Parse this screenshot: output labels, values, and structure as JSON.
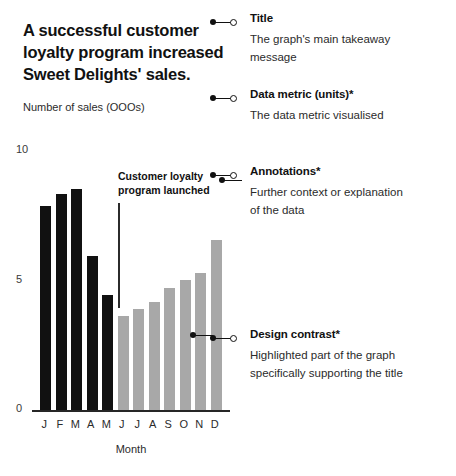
{
  "chart_data": {
    "type": "bar",
    "title": "A successful customer\nloyalty program increased\nSweet Delights' sales.",
    "ylabel": "Number of sales (OOOs)",
    "xlabel": "Month",
    "categories": [
      "J",
      "F",
      "M",
      "A",
      "M",
      "J",
      "J",
      "A",
      "S",
      "O",
      "N",
      "D"
    ],
    "category_names": [
      "January",
      "February",
      "March",
      "April",
      "May",
      "June",
      "July",
      "August",
      "September",
      "October",
      "November",
      "December"
    ],
    "values": [
      8.5,
      9.0,
      9.2,
      6.4,
      4.8,
      3.9,
      4.2,
      4.5,
      5.1,
      5.4,
      5.7,
      7.1
    ],
    "bar_colors": [
      "#111111",
      "#111111",
      "#111111",
      "#111111",
      "#111111",
      "#a8a8a8",
      "#a8a8a8",
      "#a8a8a8",
      "#a8a8a8",
      "#a8a8a8",
      "#a8a8a8",
      "#a8a8a8"
    ],
    "ylim": [
      0,
      10
    ],
    "y_ticks": [
      "10",
      "5",
      "0"
    ],
    "y_tick_values": [
      10,
      5,
      0
    ],
    "grid": false,
    "legend": false,
    "annotations": [
      {
        "text": "Customer loyalty\nprogram launched",
        "at_category": "J",
        "at_index": 5
      }
    ]
  },
  "chart": {
    "title": "A successful customer\nloyalty program increased\nSweet Delights' sales.",
    "metric_label": "Number of sales (OOOs)",
    "x_axis_title": "Month",
    "annotation_text": "Customer loyalty\nprogram launched"
  },
  "callouts": {
    "title": {
      "heading": "Title",
      "body": "The graph's main takeaway\nmessage"
    },
    "metric": {
      "heading": "Data metric (units)*",
      "body": "The data metric visualised"
    },
    "annotations": {
      "heading": "Annotations*",
      "body": "Further context or explanation\nof the data"
    },
    "contrast": {
      "heading": "Design contrast*",
      "body": "Highlighted part of the graph\nspecifically supporting the title"
    }
  },
  "colors": {
    "bar_dark": "#111111",
    "bar_light": "#a8a8a8",
    "text": "#1a1a1a",
    "background": "#ffffff"
  }
}
